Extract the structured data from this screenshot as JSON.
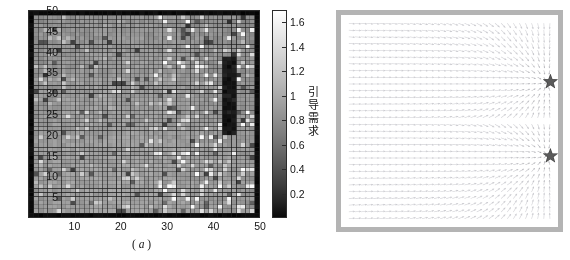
{
  "figure": {
    "width": 570,
    "height": 260,
    "background": "#ffffff"
  },
  "panel_a": {
    "name": "heatmap-panel",
    "caption_open": "(",
    "caption_letter": "a",
    "caption_close": ")",
    "caption_full": "( a )",
    "axis_color": "#2b2b2b",
    "xticks": [
      "10",
      "20",
      "30",
      "40",
      "50"
    ],
    "yticks": [
      "5",
      "10",
      "15",
      "20",
      "25",
      "30",
      "35",
      "40",
      "45",
      "50"
    ],
    "colorbar": {
      "label": "引导需求",
      "label_chars": [
        "引",
        "导",
        "需",
        "求"
      ],
      "ticks": [
        "1.6",
        "1.4",
        "1.2",
        "1",
        "0.8",
        "0.6",
        "0.4",
        "0.2"
      ],
      "tick_values": [
        1.6,
        1.4,
        1.2,
        1.0,
        0.8,
        0.6,
        0.4,
        0.2
      ],
      "vmin": 0,
      "vmax": 1.7,
      "colormap": "gray",
      "orientation": "vertical",
      "high_color": "#ffffff",
      "low_color": "#000000"
    }
  },
  "panel_b": {
    "name": "quiver-panel",
    "caption_open": "(",
    "caption_letter": "b",
    "caption_close": ")",
    "caption_full": "( b )",
    "frame_color": "#b4b4b4",
    "arrow_color": "#8c8c8c",
    "markers": [
      {
        "name": "star-marker-upper",
        "x": 0.965,
        "y": 0.315,
        "symbol": "★",
        "color": "#5a5a5a"
      },
      {
        "name": "star-marker-lower",
        "x": 0.965,
        "y": 0.665,
        "symbol": "★",
        "color": "#5a5a5a"
      }
    ]
  },
  "chart_data": [
    {
      "type": "heatmap",
      "title": "",
      "xlabel": "",
      "ylabel": "",
      "xlim": [
        0,
        50
      ],
      "ylim": [
        0,
        50
      ],
      "grid": true,
      "nx": 50,
      "ny": 50,
      "colorbar_label": "引导需求",
      "colorbar_ticks": [
        0.2,
        0.4,
        0.6,
        0.8,
        1.0,
        1.2,
        1.4,
        1.6
      ],
      "vmin": 0,
      "vmax": 1.7,
      "cmap": "gray",
      "notes": "50x50 grid of guidance-demand values, mid-gray (~0.8-1.1) across most of the field with dark (near 0) bands at the left column, right column, top row and bottom row, and scattered brighter (~1.3-1.6) cells near the right side.",
      "value_mean": 0.95,
      "value_min": 0.05,
      "value_max": 1.65
    },
    {
      "type": "quiver",
      "title": "",
      "xlabel": "",
      "ylabel": "",
      "xlim": [
        0,
        50
      ],
      "ylim": [
        0,
        50
      ],
      "grid": false,
      "nx": 34,
      "ny": 30,
      "notes": "Vector field of guidance directions; all arrows point rightward toward two attractor stars located on the right edge at about 31% and 67% of the panel height. Arrows in the central horizontal band are nearly horizontal; arrows above and below fan in toward the nearest star.",
      "attractors": [
        {
          "x": 48.5,
          "y": 34.5
        },
        {
          "x": 48.5,
          "y": 16.5
        }
      ],
      "arrow_color": "#8c8c8c",
      "marker_symbol": "star"
    }
  ]
}
